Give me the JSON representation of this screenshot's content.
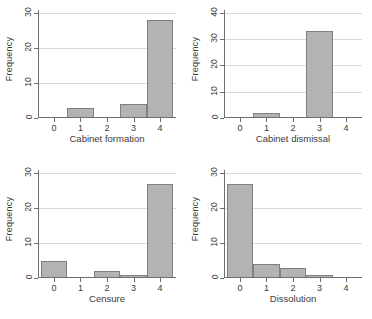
{
  "figure": {
    "panel_count": 4,
    "bar_fill_color": "#b3b3b3",
    "bar_edge_color": "#808080",
    "axis_color": "#6e6e6e",
    "gridline_color": "#d9d9d9",
    "background_color": "#ffffff",
    "shared_ylabel": "Frequency"
  },
  "chart_data": [
    {
      "type": "bar",
      "title": "",
      "xlabel": "Cabinet formation",
      "ylabel": "Frequency",
      "categories": [
        "0",
        "1",
        "2",
        "3",
        "4"
      ],
      "values": [
        0,
        3,
        0,
        4,
        28
      ],
      "xticks": [
        "0",
        "1",
        "2",
        "3",
        "4"
      ],
      "yticks": [
        0,
        10,
        20,
        30
      ],
      "ylim": [
        0,
        31
      ],
      "xlim": [
        -0.6,
        4.6
      ],
      "grid": true,
      "legend": "none"
    },
    {
      "type": "bar",
      "title": "",
      "xlabel": "Cabinet dismissal",
      "ylabel": "Frequency",
      "categories": [
        "0",
        "1",
        "2",
        "3",
        "4"
      ],
      "values": [
        0,
        2,
        0,
        33,
        0
      ],
      "xticks": [
        "0",
        "1",
        "2",
        "3",
        "4"
      ],
      "yticks": [
        0,
        10,
        20,
        30,
        40
      ],
      "ylim": [
        0,
        41
      ],
      "xlim": [
        -0.6,
        4.6
      ],
      "grid": true,
      "legend": "none"
    },
    {
      "type": "bar",
      "title": "",
      "xlabel": "Censure",
      "ylabel": "Frequency",
      "categories": [
        "0",
        "1",
        "2",
        "3",
        "4"
      ],
      "values": [
        5,
        0,
        2,
        1,
        27
      ],
      "xticks": [
        "0",
        "1",
        "2",
        "3",
        "4"
      ],
      "yticks": [
        0,
        10,
        20,
        30
      ],
      "ylim": [
        0,
        31
      ],
      "xlim": [
        -0.6,
        4.6
      ],
      "grid": true,
      "legend": "none"
    },
    {
      "type": "bar",
      "title": "",
      "xlabel": "Dissolution",
      "ylabel": "Frequency",
      "categories": [
        "0",
        "1",
        "2",
        "3",
        "4"
      ],
      "values": [
        27,
        4,
        3,
        1,
        0
      ],
      "xticks": [
        "0",
        "1",
        "2",
        "3",
        "4"
      ],
      "yticks": [
        0,
        10,
        20,
        30
      ],
      "ylim": [
        0,
        31
      ],
      "xlim": [
        -0.6,
        4.6
      ],
      "grid": true,
      "legend": "none"
    }
  ]
}
